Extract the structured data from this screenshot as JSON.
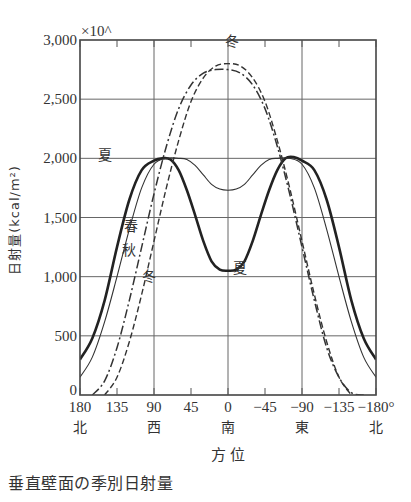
{
  "caption": "垂直壁面の季別日射量",
  "chart_data": {
    "type": "line",
    "title": "垂直壁面の季別日射量",
    "xlabel": "方 位",
    "ylabel": "日射量(kcal/m²)",
    "y_multiplier_label": "×10^",
    "ylim": [
      0,
      3000
    ],
    "xlim": [
      180,
      -180
    ],
    "x_ticks": [
      180,
      135,
      90,
      45,
      0,
      -45,
      -90,
      -135,
      -180
    ],
    "x_tick_labels": [
      "180",
      "135",
      "90",
      "45",
      "0",
      "−45",
      "−90",
      "−135",
      "−180°"
    ],
    "x_direction_labels": [
      {
        "x": 180,
        "label": "北"
      },
      {
        "x": 90,
        "label": "西"
      },
      {
        "x": 0,
        "label": "南"
      },
      {
        "x": -90,
        "label": "東"
      },
      {
        "x": -180,
        "label": "北"
      }
    ],
    "y_ticks": [
      0,
      500,
      1000,
      1500,
      2000,
      2500,
      3000
    ],
    "y_tick_labels": [
      "0",
      "500",
      "1,000",
      "1,500",
      "2,000",
      "2,500",
      "3,000"
    ],
    "grid": {
      "x": [
        90,
        0,
        -90
      ],
      "y": [
        500,
        1000,
        1500,
        2000,
        2500
      ]
    },
    "legend": "inline annotations",
    "series": [
      {
        "name": "夏",
        "style": "thick-solid",
        "x": [
          180,
          165,
          150,
          135,
          120,
          105,
          90,
          80,
          70,
          60,
          50,
          40,
          30,
          20,
          10,
          0,
          -10,
          -20,
          -30,
          -40,
          -50,
          -60,
          -70,
          -80,
          -90,
          -105,
          -120,
          -135,
          -150,
          -165,
          -180
        ],
        "values": [
          300,
          480,
          800,
          1250,
          1650,
          1900,
          1980,
          2000,
          1990,
          1900,
          1730,
          1520,
          1300,
          1130,
          1060,
          1050,
          1060,
          1130,
          1300,
          1520,
          1730,
          1900,
          2000,
          2010,
          1980,
          1900,
          1650,
          1250,
          800,
          480,
          300
        ]
      },
      {
        "name": "春・秋",
        "style": "thin-solid",
        "x": [
          180,
          165,
          150,
          135,
          120,
          105,
          90,
          75,
          60,
          50,
          40,
          30,
          20,
          10,
          0,
          -10,
          -20,
          -30,
          -40,
          -50,
          -60,
          -75,
          -90,
          -105,
          -120,
          -135,
          -150,
          -165,
          -180
        ],
        "values": [
          150,
          320,
          620,
          1000,
          1400,
          1750,
          1950,
          2000,
          2000,
          1990,
          1940,
          1860,
          1780,
          1740,
          1730,
          1740,
          1780,
          1860,
          1940,
          1990,
          2000,
          2000,
          1950,
          1750,
          1400,
          1000,
          620,
          320,
          150
        ]
      },
      {
        "name": "冬 (dashed)",
        "style": "dashed",
        "x": [
          150,
          135,
          120,
          105,
          90,
          75,
          60,
          45,
          30,
          15,
          0,
          -15,
          -30,
          -45,
          -60,
          -75,
          -90,
          -105,
          -120,
          -135,
          -150
        ],
        "values": [
          0,
          150,
          450,
          850,
          1300,
          1750,
          2150,
          2480,
          2680,
          2780,
          2800,
          2780,
          2680,
          2480,
          2150,
          1750,
          1300,
          850,
          450,
          150,
          0
        ]
      },
      {
        "name": "冬 (dash-dot)",
        "style": "dash-dot",
        "x": [
          165,
          150,
          135,
          120,
          105,
          90,
          75,
          60,
          45,
          30,
          15,
          0,
          -15,
          -30,
          -45,
          -60,
          -75,
          -90,
          -105,
          -120,
          -135,
          -150,
          -165
        ],
        "values": [
          0,
          120,
          400,
          800,
          1250,
          1700,
          2100,
          2420,
          2620,
          2720,
          2750,
          2750,
          2720,
          2620,
          2420,
          2100,
          1700,
          1250,
          800,
          400,
          150,
          20,
          0
        ]
      }
    ],
    "annotations": [
      {
        "text": "冬",
        "x": -5,
        "y": 2950
      },
      {
        "text": "夏",
        "x": 150,
        "y": 1990
      },
      {
        "text": "春",
        "x": 118,
        "y": 1390
      },
      {
        "text": "秋",
        "x": 121,
        "y": 1180
      },
      {
        "text": "冬",
        "x": 96,
        "y": 960
      },
      {
        "text": "夏",
        "x": -15,
        "y": 1030
      }
    ]
  }
}
